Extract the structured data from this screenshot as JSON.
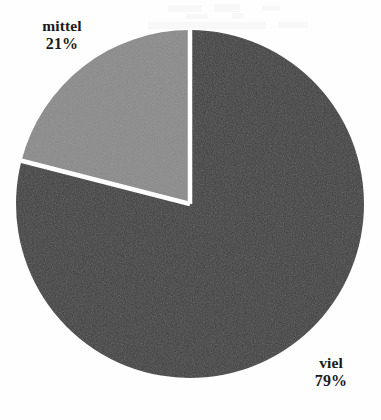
{
  "chart_data": {
    "type": "pie",
    "title": "",
    "subtitle": "",
    "xlabel": "",
    "ylabel": "",
    "legend_position": "none",
    "grid": false,
    "categories": [
      "viel",
      "mittel"
    ],
    "values": [
      79,
      21
    ],
    "units": "%",
    "slices": [
      {
        "label": "viel",
        "value": 79,
        "value_text": "79%",
        "color": "#3d3d3d",
        "start_angle_deg": 0,
        "end_angle_deg": 284.4
      },
      {
        "label": "mittel",
        "value": 21,
        "value_text": "21%",
        "color": "#8a8a8a",
        "start_angle_deg": 284.4,
        "end_angle_deg": 360
      }
    ]
  },
  "figure": {
    "background_color": "#fefefe",
    "separator_color": "#ffffff",
    "text_color": "#1a1a1a",
    "center_x": 190,
    "center_y": 204,
    "radius": 174
  },
  "labels": {
    "mittel": {
      "name": "mittel",
      "value_text": "21%"
    },
    "viel": {
      "name": "viel",
      "value_text": "79%"
    }
  }
}
